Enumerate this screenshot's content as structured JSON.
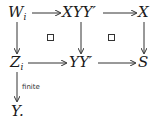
{
  "diagram": {
    "nodes": {
      "W": {
        "base": "W",
        "sub": "i"
      },
      "XYY": {
        "text": "XYY′"
      },
      "X": {
        "text": "X"
      },
      "Z": {
        "base": "Z",
        "sub": "i"
      },
      "YY": {
        "text": "YY′"
      },
      "S": {
        "text": "S"
      },
      "Y": {
        "text": "Y."
      }
    },
    "arrows": [
      {
        "from": "W_i",
        "to": "XYY′"
      },
      {
        "from": "XYY′",
        "to": "X"
      },
      {
        "from": "W_i",
        "to": "Z_i"
      },
      {
        "from": "XYY′",
        "to": "YY′"
      },
      {
        "from": "X",
        "to": "S"
      },
      {
        "from": "Z_i",
        "to": "YY′"
      },
      {
        "from": "YY′",
        "to": "S"
      },
      {
        "from": "Z_i",
        "to": "Y",
        "label": "finite"
      }
    ],
    "labels": {
      "finite": "finite"
    },
    "pullback_marks": [
      "□",
      "□"
    ]
  }
}
